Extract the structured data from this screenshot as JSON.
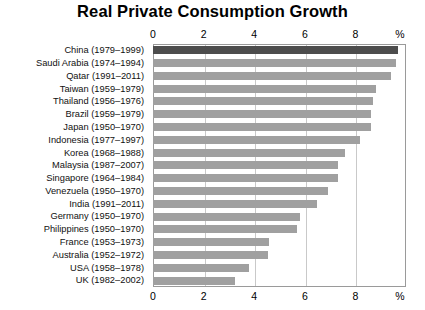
{
  "chart_data": {
    "type": "bar",
    "orientation": "horizontal",
    "title": "Real Private Consumption Growth",
    "xlabel": "%",
    "ylabel": "",
    "xlim": [
      0,
      10
    ],
    "xticks": [
      0,
      2,
      4,
      6,
      8
    ],
    "xtick_labels": [
      "0",
      "2",
      "4",
      "6",
      "8"
    ],
    "axis_unit_label": "%",
    "grid": true,
    "grid_axis": "x",
    "axis_positions": [
      "top",
      "bottom"
    ],
    "legend": null,
    "bar_color": "#a0a0a0",
    "highlight_color": "#4d4d4d",
    "highlight_category": "China (1979–1999)",
    "categories": [
      "China (1979–1999)",
      "Saudi Arabia (1974–1994)",
      "Qatar (1991–2011)",
      "Taiwan (1959–1979)",
      "Thailand (1956–1976)",
      "Brazil (1959–1979)",
      "Japan (1950–1970)",
      "Indonesia (1977–1997)",
      "Korea (1968–1988)",
      "Malaysia (1987–2007)",
      "Singapore (1964–1984)",
      "Venezuela (1950–1970)",
      "India (1991–2011)",
      "Germany (1950–1970)",
      "Philippines (1950–1970)",
      "France (1953–1973)",
      "Australia (1952–1972)",
      "USA (1958–1978)",
      "UK (1982–2002)"
    ],
    "values": [
      9.7,
      9.6,
      9.4,
      8.8,
      8.7,
      8.6,
      8.6,
      8.2,
      7.6,
      7.3,
      7.3,
      6.9,
      6.5,
      5.8,
      5.7,
      4.6,
      4.55,
      3.8,
      3.25
    ]
  }
}
